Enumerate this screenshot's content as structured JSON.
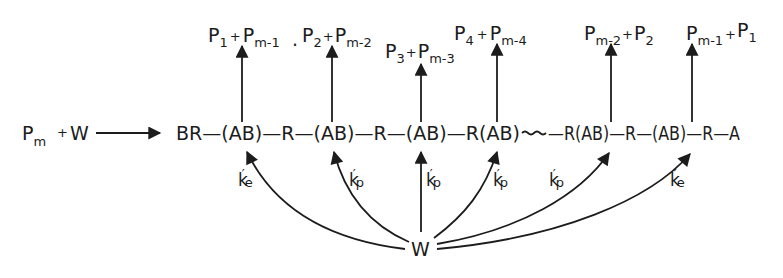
{
  "diagram": {
    "reactants": {
      "polymer": "P",
      "polymer_sub": "m",
      "plus": "+",
      "water": "W"
    },
    "chain": {
      "segments": [
        "BR",
        "(AB)",
        "R",
        "(AB)",
        "R",
        "(AB)",
        "R",
        "(AB)",
        "~~~",
        "R",
        "(AB)",
        "R",
        "(AB)",
        "R",
        "A"
      ],
      "text_parts": [
        "BR—(AB)—R—(AB)—R—(AB)—R(AB)",
        "~~~~",
        "—R(AB)—R—(AB)—R—A"
      ]
    },
    "products": [
      {
        "a": "P",
        "a_sub": "1",
        "plus": "+",
        "b": "P",
        "b_sub": "m-1"
      },
      {
        "a": "P",
        "a_sub": "2",
        "plus": "+",
        "b": "P",
        "b_sub": "m-2"
      },
      {
        "a": "P",
        "a_sub": "3",
        "plus": "+",
        "b": "P",
        "b_sub": "m-3"
      },
      {
        "a": "P",
        "a_sub": "4",
        "plus": "+",
        "b": "P",
        "b_sub": "m-4"
      },
      {
        "a": "P",
        "a_sub": "m-2",
        "plus": "+",
        "b": "P",
        "b_sub": "2"
      },
      {
        "a": "P",
        "a_sub": "m-1",
        "plus": "+",
        "b": "P",
        "b_sub": "1"
      }
    ],
    "separator_dot": ".",
    "rate_constants": [
      {
        "k": "k",
        "prime": "′",
        "sub": "e"
      },
      {
        "k": "k",
        "prime": "′",
        "sub": "p"
      },
      {
        "k": "k",
        "prime": "′",
        "sub": "p"
      },
      {
        "k": "k",
        "prime": "′",
        "sub": "p"
      },
      {
        "k": "k",
        "prime": "′",
        "sub": "p"
      },
      {
        "k": "k",
        "prime": "′",
        "sub": "e"
      }
    ],
    "water_node": "W",
    "colors": {
      "ink": "#1c1c1c",
      "background": "#ffffff"
    }
  }
}
